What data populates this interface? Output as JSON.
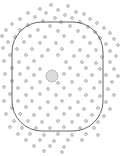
{
  "figure": {
    "width": 134,
    "height": 156,
    "colors": {
      "background": "#ffffff",
      "dot_stroke": "#9a9a9a",
      "dot_fill": "#e6e6e6",
      "boundary_stroke": "#555555",
      "center_stroke": "#a8a8a8",
      "center_fill": "#dcdcdc"
    },
    "boundary": {
      "shape": "rounded-rectangle",
      "x": 12,
      "y": 22,
      "width": 91,
      "height": 109,
      "corner_radius": 30
    },
    "center_particle": {
      "cx": 52,
      "cy": 76,
      "r": 6
    },
    "particle_radius": 1.4,
    "particles": [
      [
        51,
        5
      ],
      [
        68,
        6
      ],
      [
        40,
        9
      ],
      [
        58,
        10
      ],
      [
        76,
        12
      ],
      [
        28,
        13
      ],
      [
        46,
        13
      ],
      [
        65,
        15
      ],
      [
        84,
        14
      ],
      [
        35,
        17
      ],
      [
        55,
        18
      ],
      [
        72,
        18
      ],
      [
        90,
        19
      ],
      [
        20,
        19
      ],
      [
        43,
        21
      ],
      [
        61,
        22
      ],
      [
        80,
        22
      ],
      [
        97,
        23
      ],
      [
        12,
        24
      ],
      [
        28,
        25
      ],
      [
        50,
        26
      ],
      [
        70,
        26
      ],
      [
        88,
        27
      ],
      [
        104,
        28
      ],
      [
        6,
        30
      ],
      [
        20,
        30
      ],
      [
        38,
        30
      ],
      [
        58,
        31
      ],
      [
        78,
        31
      ],
      [
        95,
        32
      ],
      [
        110,
        33
      ],
      [
        2,
        36
      ],
      [
        15,
        37
      ],
      [
        30,
        36
      ],
      [
        45,
        37
      ],
      [
        64,
        36
      ],
      [
        84,
        37
      ],
      [
        100,
        38
      ],
      [
        114,
        39
      ],
      [
        8,
        42
      ],
      [
        24,
        42
      ],
      [
        40,
        43
      ],
      [
        56,
        43
      ],
      [
        72,
        42
      ],
      [
        90,
        43
      ],
      [
        106,
        44
      ],
      [
        118,
        45
      ],
      [
        3,
        48
      ],
      [
        17,
        49
      ],
      [
        32,
        49
      ],
      [
        48,
        50
      ],
      [
        62,
        49
      ],
      [
        80,
        50
      ],
      [
        96,
        50
      ],
      [
        110,
        51
      ],
      [
        10,
        55
      ],
      [
        26,
        55
      ],
      [
        42,
        56
      ],
      [
        58,
        55
      ],
      [
        74,
        56
      ],
      [
        88,
        56
      ],
      [
        102,
        57
      ],
      [
        116,
        56
      ],
      [
        4,
        61
      ],
      [
        19,
        62
      ],
      [
        34,
        61
      ],
      [
        66,
        62
      ],
      [
        82,
        62
      ],
      [
        96,
        63
      ],
      [
        110,
        62
      ],
      [
        12,
        68
      ],
      [
        28,
        68
      ],
      [
        40,
        69
      ],
      [
        70,
        68
      ],
      [
        86,
        68
      ],
      [
        100,
        69
      ],
      [
        114,
        69
      ],
      [
        5,
        74
      ],
      [
        20,
        74
      ],
      [
        34,
        75
      ],
      [
        64,
        74
      ],
      [
        78,
        75
      ],
      [
        92,
        75
      ],
      [
        106,
        75
      ],
      [
        118,
        76
      ],
      [
        12,
        81
      ],
      [
        26,
        81
      ],
      [
        40,
        82
      ],
      [
        58,
        83
      ],
      [
        72,
        82
      ],
      [
        86,
        81
      ],
      [
        100,
        82
      ],
      [
        112,
        82
      ],
      [
        4,
        87
      ],
      [
        18,
        88
      ],
      [
        32,
        88
      ],
      [
        48,
        89
      ],
      [
        64,
        88
      ],
      [
        80,
        89
      ],
      [
        94,
        88
      ],
      [
        108,
        89
      ],
      [
        10,
        94
      ],
      [
        26,
        95
      ],
      [
        40,
        94
      ],
      [
        56,
        95
      ],
      [
        70,
        95
      ],
      [
        86,
        95
      ],
      [
        100,
        96
      ],
      [
        114,
        95
      ],
      [
        4,
        101
      ],
      [
        18,
        101
      ],
      [
        32,
        101
      ],
      [
        48,
        102
      ],
      [
        62,
        101
      ],
      [
        78,
        102
      ],
      [
        92,
        101
      ],
      [
        106,
        102
      ],
      [
        12,
        108
      ],
      [
        26,
        107
      ],
      [
        40,
        108
      ],
      [
        56,
        108
      ],
      [
        70,
        108
      ],
      [
        84,
        109
      ],
      [
        98,
        108
      ],
      [
        110,
        109
      ],
      [
        6,
        114
      ],
      [
        20,
        114
      ],
      [
        34,
        115
      ],
      [
        48,
        115
      ],
      [
        64,
        114
      ],
      [
        78,
        115
      ],
      [
        92,
        115
      ],
      [
        104,
        116
      ],
      [
        14,
        121
      ],
      [
        28,
        121
      ],
      [
        42,
        122
      ],
      [
        58,
        121
      ],
      [
        72,
        122
      ],
      [
        86,
        121
      ],
      [
        98,
        122
      ],
      [
        10,
        127
      ],
      [
        22,
        128
      ],
      [
        36,
        128
      ],
      [
        50,
        128
      ],
      [
        64,
        127
      ],
      [
        80,
        128
      ],
      [
        94,
        128
      ],
      [
        18,
        134
      ],
      [
        30,
        134
      ],
      [
        44,
        135
      ],
      [
        58,
        134
      ],
      [
        72,
        135
      ],
      [
        86,
        134
      ],
      [
        98,
        135
      ],
      [
        26,
        140
      ],
      [
        40,
        140
      ],
      [
        54,
        141
      ],
      [
        68,
        140
      ],
      [
        82,
        140
      ],
      [
        34,
        146
      ],
      [
        50,
        146
      ],
      [
        64,
        147
      ],
      [
        44,
        151
      ],
      [
        62,
        152
      ]
    ]
  }
}
